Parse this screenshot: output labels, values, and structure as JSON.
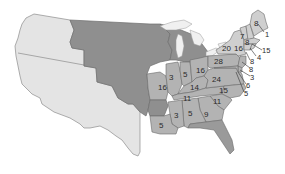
{
  "map": {
    "subject": "United States electoral representation by state",
    "colors": {
      "background": "#ffffff",
      "western_region": "#e4e4e4",
      "territory": "#8f8f8f",
      "states": "#b3b3b3",
      "borders": "#6a6a6a",
      "lakes": "#f0f0f0",
      "label_text": "#2a2a2a"
    },
    "regions": [
      {
        "id": "western-region",
        "label": ""
      },
      {
        "id": "unorganized-territory",
        "label": ""
      },
      {
        "id": "states",
        "label": ""
      }
    ],
    "state_labels": [
      {
        "id": "maine",
        "value": "8"
      },
      {
        "id": "maine-outer",
        "value": "1"
      },
      {
        "id": "vermont",
        "value": "7"
      },
      {
        "id": "new-hampshire",
        "value": "8"
      },
      {
        "id": "massachusetts",
        "value": "15"
      },
      {
        "id": "rhode-island",
        "value": "4"
      },
      {
        "id": "connecticut",
        "value": "8"
      },
      {
        "id": "new-york",
        "value": "16"
      },
      {
        "id": "new-york-west",
        "value": "20"
      },
      {
        "id": "pennsylvania",
        "value": "28"
      },
      {
        "id": "new-jersey",
        "value": "8"
      },
      {
        "id": "delaware",
        "value": "3"
      },
      {
        "id": "maryland",
        "value": "6"
      },
      {
        "id": "dc-area",
        "value": "5"
      },
      {
        "id": "ohio",
        "value": "16"
      },
      {
        "id": "indiana",
        "value": "5"
      },
      {
        "id": "illinois",
        "value": "3"
      },
      {
        "id": "missouri",
        "value": "3"
      },
      {
        "id": "kentucky",
        "value": "14"
      },
      {
        "id": "virginia",
        "value": "24"
      },
      {
        "id": "north-carolina",
        "value": "15"
      },
      {
        "id": "tennessee",
        "value": "11"
      },
      {
        "id": "south-carolina",
        "value": "11"
      },
      {
        "id": "georgia",
        "value": "9"
      },
      {
        "id": "alabama",
        "value": "5"
      },
      {
        "id": "mississippi",
        "value": "3"
      },
      {
        "id": "louisiana",
        "value": "5"
      }
    ]
  }
}
